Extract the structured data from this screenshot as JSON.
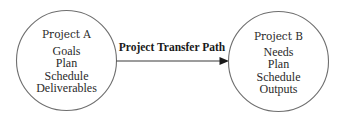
{
  "diagram": {
    "type": "flow",
    "nodes": [
      {
        "id": "project-a",
        "title": "Project A",
        "items": [
          "Goals",
          "Plan",
          "Schedule",
          "Deliverables"
        ]
      },
      {
        "id": "project-b",
        "title": "Project B",
        "items": [
          "Needs",
          "Plan",
          "Schedule",
          "Outputs"
        ]
      }
    ],
    "edges": [
      {
        "from": "project-a",
        "to": "project-b",
        "label": "Project Transfer Path"
      }
    ]
  }
}
